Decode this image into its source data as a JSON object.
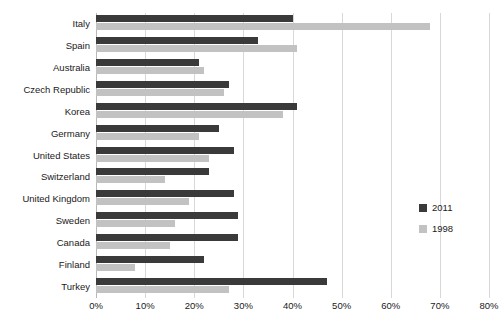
{
  "chart_data": {
    "type": "bar",
    "orientation": "horizontal",
    "title": "",
    "xlabel": "",
    "ylabel": "",
    "xlim": [
      0,
      80
    ],
    "xticks": [
      "0%",
      "10%",
      "20%",
      "30%",
      "40%",
      "50%",
      "60%",
      "70%",
      "80%"
    ],
    "xtick_values": [
      0,
      10,
      20,
      30,
      40,
      50,
      60,
      70,
      80
    ],
    "grid": true,
    "legend_position": "right",
    "categories": [
      "Italy",
      "Spain",
      "Australia",
      "Czech Republic",
      "Korea",
      "Germany",
      "United States",
      "Switzerland",
      "United Kingdom",
      "Sweden",
      "Canada",
      "Finland",
      "Turkey"
    ],
    "series": [
      {
        "name": "2011",
        "color": "#3a3a3a",
        "values": [
          40,
          33,
          21,
          27,
          41,
          25,
          28,
          23,
          28,
          29,
          29,
          22,
          47
        ]
      },
      {
        "name": "1998",
        "color": "#c2c2c2",
        "values": [
          68,
          41,
          22,
          26,
          38,
          21,
          23,
          14,
          19,
          16,
          15,
          8,
          27
        ]
      }
    ]
  },
  "legend": {
    "entries": [
      {
        "label": "2011",
        "color": "#3a3a3a"
      },
      {
        "label": "1998",
        "color": "#c2c2c2"
      }
    ]
  }
}
